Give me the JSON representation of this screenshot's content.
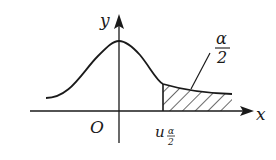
{
  "diagram": {
    "type": "normal-distribution-upper-tail",
    "axis_labels": {
      "x": "x",
      "y": "y",
      "origin": "O"
    },
    "critical_value": {
      "base": "u",
      "subscript_num": "α",
      "subscript_den": "2"
    },
    "tail_area": {
      "num": "α",
      "den": "2"
    },
    "colors": {
      "stroke": "#1a1a1a",
      "background": "#ffffff"
    }
  }
}
